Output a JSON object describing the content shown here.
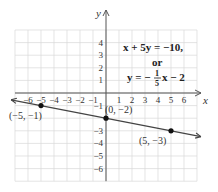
{
  "chart_data": {
    "type": "line",
    "title": "",
    "xlabel": "x",
    "ylabel": "y",
    "xlim": [
      -7,
      7
    ],
    "ylim": [
      -7,
      5
    ],
    "grid": true,
    "x_ticks": [
      "-6",
      "-5",
      "-4",
      "-3",
      "-2",
      "-1",
      "1",
      "2",
      "3",
      "4",
      "5",
      "6"
    ],
    "y_ticks": [
      "4",
      "3",
      "2",
      "1",
      "-1",
      "-3",
      "-4",
      "-5",
      "-6"
    ],
    "series": [
      {
        "name": "x + 5y = -10",
        "equation": "y = -1/5 x - 2",
        "slope": -0.2,
        "intercept": -2,
        "points": [
          {
            "x": -5,
            "y": -1,
            "label": "(−5, −1)"
          },
          {
            "x": 0,
            "y": -2,
            "label": "(0, −2)"
          },
          {
            "x": 5,
            "y": -3,
            "label": "(5, −3)"
          }
        ]
      }
    ],
    "annotations": {
      "line1": "x + 5y = −10,",
      "line2": "or",
      "line3_prefix": "y = −",
      "frac_num": "1",
      "frac_den": "5",
      "line3_suffix": "x − 2"
    },
    "colors": {
      "grid": "#d8d8d8",
      "axis": "#555555",
      "line": "#444444",
      "point": "#111111"
    }
  }
}
